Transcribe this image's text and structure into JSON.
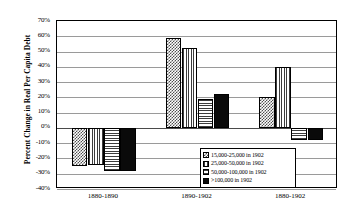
{
  "chart_data": {
    "type": "bar",
    "title": "",
    "subtitle": "",
    "xlabel": "",
    "ylabel": "Percent Change in Real Per Capita Debt",
    "categories": [
      "1880-1890",
      "1890-1902",
      "1880-1902"
    ],
    "ylim": [
      -40,
      70
    ],
    "ytick_step": 10,
    "ytick_labels": [
      "70%",
      "60%",
      "50%",
      "40%",
      "30%",
      "20%",
      "10%",
      "0%",
      "-10%",
      "-20%",
      "-30%",
      "-40%"
    ],
    "ytick_values": [
      70,
      60,
      50,
      40,
      30,
      20,
      10,
      0,
      -10,
      -20,
      -30,
      -40
    ],
    "grid": true,
    "legend_position": "inside-bottom-right",
    "series": [
      {
        "name": "15,000-25,000 in 1902",
        "pattern": "checker",
        "values": [
          -25,
          59,
          20
        ]
      },
      {
        "name": "25,000-50,000 in 1902",
        "pattern": "vertical-lines",
        "values": [
          -24,
          52,
          40
        ]
      },
      {
        "name": "50,000-100,000 in 1902",
        "pattern": "horizontal-lines",
        "values": [
          -28,
          19,
          -8
        ]
      },
      {
        "name": ">100,000 in 1902",
        "pattern": "solid-black",
        "values": [
          -28,
          22,
          -8
        ]
      }
    ]
  },
  "legend": {
    "items": [
      {
        "label": "15,000-25,000 in 1902"
      },
      {
        "label": "25,000-50,000 in 1902"
      },
      {
        "label": "50,000-100,000 in 1902"
      },
      {
        "label": ">100,000 in 1902"
      }
    ]
  },
  "colors": {
    "axis": "#000000",
    "gridline": "#9a9a9a",
    "zero_line": "#4a4a4a",
    "bar_solid": "#0a0a0a",
    "background": "#ffffff"
  }
}
